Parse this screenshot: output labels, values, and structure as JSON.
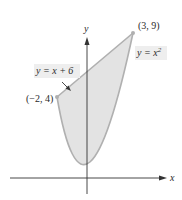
{
  "diagram": {
    "type": "area-between-curves",
    "axes": {
      "x_label": "x",
      "y_label": "y"
    },
    "curves": [
      {
        "id": "line",
        "equation": "y = x + 6"
      },
      {
        "id": "parabola",
        "equation": "y = x^2",
        "label_base": "y = x",
        "label_exponent": "2"
      }
    ],
    "points": [
      {
        "label": "(3, 9)",
        "x": 3,
        "y": 9
      },
      {
        "label": "(−2, 4)",
        "x": -2,
        "y": 4
      }
    ],
    "shaded_region": "between y = x + 6 (above) and y = x^2 (below), for −2 ≤ x ≤ 3",
    "colors": {
      "fill": "#e3e3e3",
      "curve": "#b0b0b0",
      "axis": "#333333",
      "text": "#2a2a2a",
      "label_bg": "#eeeeee"
    },
    "note": "Labeled points are placed at their measured pixel positions. The source figure's vertical scale is not uniform, so the parabola is drawn as a smooth curve through the vertex and both endpoints rather than as an exact plot of x^2."
  },
  "labels": {
    "y_axis": "y",
    "x_axis": "x",
    "point_top": "(3, 9)",
    "point_left": "(−2, 4)",
    "line_eq": "y = x + 6",
    "parabola_base": "y = x",
    "parabola_exp": "2"
  }
}
